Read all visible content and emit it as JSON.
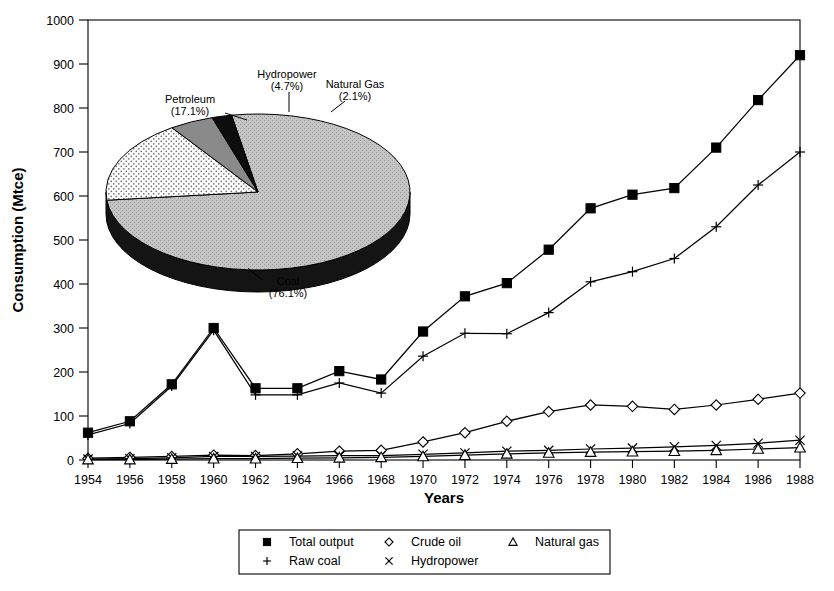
{
  "chart_data": {
    "type": "line",
    "title": "",
    "xlabel": "Years",
    "ylabel": "Consumption (Mtce)",
    "xlim": [
      1954,
      1988
    ],
    "ylim": [
      0,
      1000
    ],
    "ytick_step": 100,
    "xtick_step": 2,
    "grid": false,
    "legend_position": "bottom",
    "categories": [
      1954,
      1956,
      1958,
      1960,
      1962,
      1964,
      1966,
      1968,
      1970,
      1972,
      1974,
      1976,
      1978,
      1980,
      1982,
      1984,
      1986,
      1988
    ],
    "yticks": [
      0,
      100,
      200,
      300,
      400,
      500,
      600,
      700,
      800,
      900,
      1000
    ],
    "xticks": [
      "1954",
      "1956",
      "1958",
      "1960",
      "1962",
      "1964",
      "1966",
      "1968",
      "1970",
      "1972",
      "1974",
      "1976",
      "1978",
      "1980",
      "1982",
      "1984",
      "1986",
      "1988"
    ],
    "series": [
      {
        "name": "Total output",
        "marker": "filled-square",
        "values": [
          62,
          88,
          172,
          300,
          163,
          163,
          202,
          183,
          292,
          372,
          402,
          478,
          572,
          603,
          618,
          710,
          818,
          920
        ]
      },
      {
        "name": "Raw coal",
        "marker": "plus",
        "values": [
          57,
          83,
          168,
          295,
          148,
          148,
          175,
          152,
          236,
          288,
          287,
          335,
          405,
          428,
          458,
          530,
          625,
          700
        ]
      },
      {
        "name": "Crude oil",
        "marker": "diamond",
        "values": [
          4,
          6,
          8,
          11,
          10,
          14,
          20,
          22,
          41,
          62,
          88,
          110,
          125,
          122,
          115,
          125,
          138,
          152
        ]
      },
      {
        "name": "Hydropower",
        "marker": "cross",
        "values": [
          2,
          3,
          5,
          8,
          8,
          9,
          10,
          10,
          13,
          16,
          20,
          22,
          25,
          27,
          30,
          33,
          38,
          45
        ]
      },
      {
        "name": "Natural gas",
        "marker": "triangle",
        "values": [
          1,
          1,
          2,
          3,
          3,
          4,
          5,
          6,
          8,
          11,
          14,
          16,
          18,
          19,
          20,
          22,
          25,
          28
        ]
      }
    ]
  },
  "pie_data": {
    "type": "pie",
    "slices": [
      {
        "label": "Coal",
        "percent_text": "(76.1%)",
        "value": 76.1,
        "fill": "coal-gray-stipple"
      },
      {
        "label": "Petroleum",
        "percent_text": "(17.1%)",
        "value": 17.1,
        "fill": "white-dot"
      },
      {
        "label": "Hydropower",
        "percent_text": "(4.7%)",
        "value": 4.7,
        "fill": "medium-gray"
      },
      {
        "label": "Natural Gas",
        "percent_text": "(2.1%)",
        "value": 2.1,
        "fill": "black"
      }
    ]
  },
  "legend": {
    "items": [
      {
        "label": "Total output",
        "marker": "filled-square"
      },
      {
        "label": "Crude oil",
        "marker": "diamond"
      },
      {
        "label": "Natural gas",
        "marker": "triangle"
      },
      {
        "label": "Raw coal",
        "marker": "plus"
      },
      {
        "label": "Hydropower",
        "marker": "cross"
      }
    ]
  },
  "colors": {
    "axis": "#000000",
    "line": "#000000",
    "coal_slice": "#bdbdbd",
    "hydro_slice": "#8a8a8a",
    "gas_slice": "#0d0d0d",
    "petroleum_slice": "#ffffff",
    "pie_side": "#141414"
  }
}
